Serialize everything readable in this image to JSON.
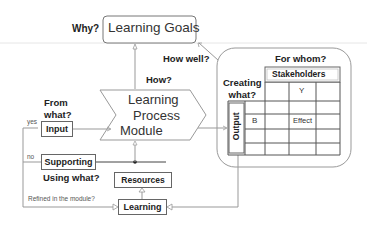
{
  "diagram": {
    "goals": {
      "question": "Why?",
      "label": "Learning Goals"
    },
    "how_well": "How well?",
    "how": "How?",
    "process": {
      "line1": "Learning",
      "line2": "Process",
      "line3": "Module"
    },
    "from_what": {
      "line1": "From",
      "line2": "what?"
    },
    "input": {
      "label": "Input",
      "branch": "yes"
    },
    "supporting": {
      "label": "Supporting",
      "branch": "no",
      "question": "Using what?"
    },
    "resources": {
      "label": "Resources"
    },
    "learning": {
      "label": "Learning",
      "question": "Refined in the module?"
    },
    "outcome": {
      "for_whom": "For whom?",
      "stakeholders": "Stakeholders",
      "creating_what": {
        "line1": "Creating",
        "line2": "what?"
      },
      "output": "Output",
      "col_header": "Y",
      "row_header": "B",
      "cell": "Effect"
    }
  },
  "colors": {
    "line": "#7a7a7a",
    "box_border": "#666666",
    "text": "#222222"
  }
}
